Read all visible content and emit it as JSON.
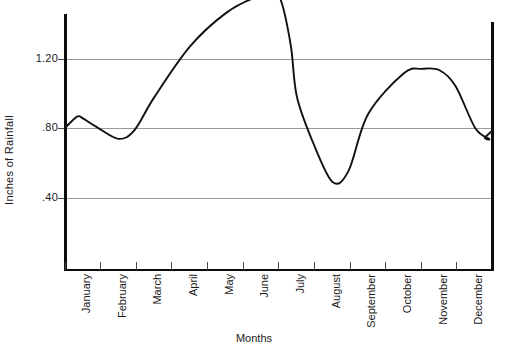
{
  "chart_data": {
    "type": "line",
    "title": "",
    "xlabel": "Months",
    "ylabel": "Inches  of  Rainfall",
    "categories": [
      "January",
      "February",
      "March",
      "April",
      "May",
      "June",
      "July",
      "August",
      "September",
      "October",
      "November",
      "December"
    ],
    "values": [
      0.8,
      0.86,
      0.62,
      0.33,
      0.13,
      0.05,
      0.62,
      1.11,
      0.72,
      0.47,
      0.47,
      0.83
    ],
    "series": [
      {
        "name": "Rainfall",
        "values": [
          0.8,
          0.86,
          0.62,
          0.33,
          0.13,
          0.05,
          0.62,
          1.11,
          0.72,
          0.47,
          0.47,
          0.83
        ]
      }
    ],
    "ytick_labels": [
      "1.20",
      ".80",
      ".40"
    ],
    "ytick_values": [
      1.2,
      0.8,
      0.4
    ],
    "ylim": [
      0.0,
      1.48
    ],
    "xlim": [
      0,
      12
    ],
    "grid": true,
    "legend": "none",
    "line_color": "#111111",
    "grid_color": "#9a9a9a",
    "axis_color": "#0d0d0d",
    "annotations": [
      {
        "label": "January start value",
        "value": 0.8
      },
      {
        "label": "early dip after January",
        "value": 0.74
      },
      {
        "label": "February peak",
        "value": 0.86
      },
      {
        "label": "June minimum",
        "value": 0.05
      },
      {
        "label": "August maximum",
        "value": 1.11
      },
      {
        "label": "October-November minimum",
        "value": 0.46
      },
      {
        "label": "December local peak",
        "value": 0.86
      },
      {
        "label": "December end value",
        "value": 0.81
      }
    ]
  },
  "axes": {
    "y_title": "Inches  of  Rainfall",
    "x_title": "Months",
    "y_labels": [
      {
        "text": "1.20",
        "value": 1.2
      },
      {
        "text": ".80",
        "value": 0.8
      },
      {
        "text": ".40",
        "value": 0.4
      }
    ],
    "x_labels": [
      {
        "text": "January"
      },
      {
        "text": "February"
      },
      {
        "text": "March"
      },
      {
        "text": "April"
      },
      {
        "text": "May"
      },
      {
        "text": "June"
      },
      {
        "text": "July"
      },
      {
        "text": "August"
      },
      {
        "text": "September"
      },
      {
        "text": "October"
      },
      {
        "text": "November"
      },
      {
        "text": "December"
      }
    ]
  }
}
